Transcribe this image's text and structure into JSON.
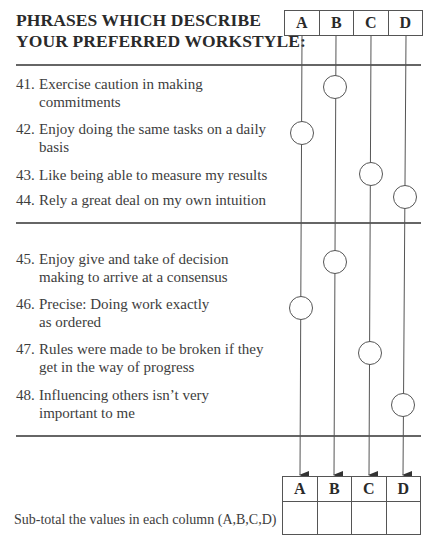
{
  "title": {
    "line1": "PHRASES WHICH DESCRIBE",
    "line2": "YOUR PREFERRED WORKSTYLE:"
  },
  "columns": [
    "A",
    "B",
    "C",
    "D"
  ],
  "sections": [
    {
      "items": [
        {
          "number": "41.",
          "text": "Exercise caution in making commitments",
          "column": "B"
        },
        {
          "number": "42.",
          "text": "Enjoy doing the same tasks on a daily basis",
          "column": "A"
        },
        {
          "number": "43.",
          "text": "Like being able to measure my results",
          "column": "C"
        },
        {
          "number": "44.",
          "text": "Rely a great deal on my own intuition",
          "column": "D"
        }
      ]
    },
    {
      "items": [
        {
          "number": "45.",
          "text": "Enjoy give and take of decision making to arrive at a consensus",
          "column": "B"
        },
        {
          "number": "46.",
          "text": "Precise: Doing work exactly as ordered",
          "column": "A"
        },
        {
          "number": "47.",
          "text": "Rules were made to be broken if they get in the way of progress",
          "column": "C"
        },
        {
          "number": "48.",
          "text": "Influencing others isn’t very important to me",
          "column": "D"
        }
      ]
    }
  ],
  "subtotal": {
    "label": "Sub-total the values in each column (A,B,C,D)",
    "values": [
      "",
      "",
      "",
      ""
    ]
  },
  "colors": {
    "line": "#555555",
    "text": "#3d3d3d",
    "heading": "#2a2a2a"
  }
}
